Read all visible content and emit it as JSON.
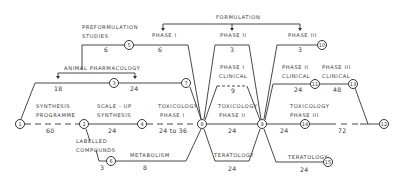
{
  "colors": {
    "line": "#333333",
    "text": "#3a3a3a",
    "background": "#ffffff"
  },
  "top": {
    "formulation": "FORMULATION",
    "phase1": "PHASE I",
    "phase2": "PHASE II",
    "phase3": "PHASE III"
  },
  "labels": {
    "preformulation_line1": "PREFORMULATION",
    "preformulation_line2": "STUDIES",
    "animal_pharmacology": "ANIMAL PHARMACOLOGY",
    "synthesis_line1": "SYNTHESIS",
    "synthesis_line2": "PROGRAMME",
    "scaleup_line1": "SCALE - UP",
    "scaleup_line2": "SYNTHESIS",
    "tox1_line1": "TOXICOLOGY",
    "tox1_line2": "PHASE I",
    "tox2_line1": "TOXICOLOGY",
    "tox2_line2": "PHASE II",
    "tox3_line1": "TOXICOLOGY",
    "tox3_line2": "PHASE III",
    "labelled_line1": "LABELLED",
    "labelled_line2": "COMPOUNDS",
    "metabolism": "METABOLISM",
    "phase1_clinical_line1": "PHASE I",
    "phase1_clinical_line2": "CLINICAL",
    "phase2_clinical_line1": "PHASE II",
    "phase2_clinical_line2": "CLINICAL",
    "phase3_clinical_line1": "PHASE III",
    "phase3_clinical_line2": "CLINICAL",
    "teratology1": "TERATOLOGY",
    "teratology2": "TERATOLOGY"
  },
  "durations": {
    "preform": "6",
    "phase1_form": "6",
    "phase2_form": "3",
    "phase3_form": "3",
    "animal_left": "18",
    "animal_right": "24",
    "synthesis": "60",
    "scaleup": "24",
    "tox1": "24 to 36",
    "labelled": "3",
    "metabolism": "8",
    "phase1_clinical": "9",
    "tox2": "24",
    "teratology1": "24",
    "tox3": "24",
    "tox3_dashed": "72",
    "phase2_clinical": "24",
    "phase3_clinical": "48",
    "teratology2": "24"
  },
  "nodes": {
    "n1": "1",
    "n2": "2",
    "n3": "3",
    "n4": "4",
    "n5": "5",
    "n6": "6",
    "n7": "7",
    "n8": "8",
    "n9": "9",
    "n10": "10",
    "n11": "11",
    "n12": "12",
    "n13": "13",
    "n14": "14",
    "n15": "15"
  }
}
